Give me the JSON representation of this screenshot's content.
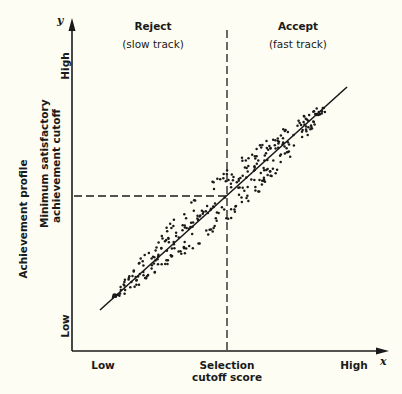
{
  "chart_data": {
    "type": "scatter",
    "title": "",
    "xlabel": "x",
    "ylabel": "Achievement profile",
    "x_axis": {
      "letter": "x",
      "tick_low": "Low",
      "tick_high": "High",
      "cutoff_label_line1": "Selection",
      "cutoff_label_line2": "cutoff score"
    },
    "y_axis": {
      "letter": "y",
      "title": "Achievement profile",
      "tick_low": "Low",
      "tick_high": "High",
      "cutoff_label_line1": "Minimum satisfactory",
      "cutoff_label_line2": "achievement cutoff"
    },
    "regions": [
      {
        "name": "Reject",
        "subtitle": "(slow track)",
        "side": "left of selection cutoff"
      },
      {
        "name": "Accept",
        "subtitle": "(fast track)",
        "side": "right of selection cutoff"
      }
    ],
    "regression_line": {
      "from": [
        0.09,
        0.12
      ],
      "to": [
        0.87,
        0.83
      ]
    },
    "selection_cutoff_x": 0.49,
    "achievement_cutoff_y": 0.47,
    "scatter_description": "Elliptical cloud of points tightly distributed around a positive linear regression line, from low-low to high-high",
    "grid": false,
    "legend": null
  },
  "labels": {
    "reject_title": "Reject",
    "reject_subtitle": "(slow track)",
    "accept_title": "Accept",
    "accept_subtitle": "(fast track)",
    "y_letter": "y",
    "x_letter": "x",
    "y_high": "High",
    "y_low": "Low",
    "x_low": "Low",
    "x_high": "High",
    "y_title": "Achievement profile",
    "y_cutoff_1": "Minimum satisfactory",
    "y_cutoff_2": "achievement cutoff",
    "x_cutoff_1": "Selection",
    "x_cutoff_2": "cutoff score"
  },
  "colors": {
    "background": "#fdfdf3",
    "ink": "#1a1a1a"
  }
}
